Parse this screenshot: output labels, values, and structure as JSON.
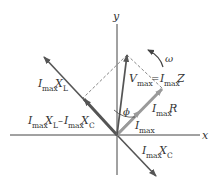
{
  "diagram": {
    "type": "phasor-diagram",
    "axes": {
      "x_label": "x",
      "y_label": "y"
    },
    "labels": {
      "omega": "ω",
      "phi": "ϕ",
      "vmax_V": "V",
      "vmax_sub": "max",
      "vmax_eq": " = ",
      "vmax_I": "I",
      "vmax_I_sub": "max",
      "vmax_Z": "Z",
      "imaxXL_I": "I",
      "imaxXL_sub": "max",
      "imaxXL_X": "X",
      "imaxXL_Xsub": "L",
      "diff_I1": "I",
      "diff_sub1": "max",
      "diff_X1": "X",
      "diff_Xsub1": "L",
      "diff_minus": "–",
      "diff_I2": "I",
      "diff_sub2": "max",
      "diff_X2": "X",
      "diff_Xsub2": "C",
      "imaxR_I": "I",
      "imaxR_sub": "max",
      "imaxR_R": "R",
      "imax_I": "I",
      "imax_sub": "max",
      "imaxXC_I": "I",
      "imaxXC_sub": "max",
      "imaxXC_X": "X",
      "imaxXC_Xsub": "C"
    },
    "colors": {
      "axis": "#444444",
      "phasor_dark": "#555555",
      "phasor_light": "#9a9a9a",
      "dashed": "#666666",
      "text": "#333333"
    }
  }
}
